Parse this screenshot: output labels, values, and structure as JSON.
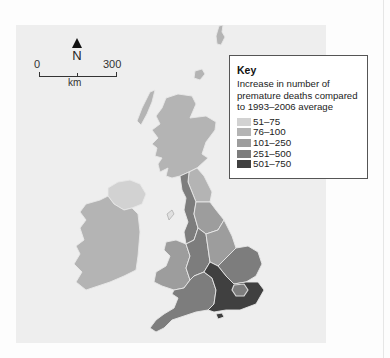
{
  "map": {
    "north_label": "N",
    "scale": {
      "zero": "0",
      "max": "300",
      "unit": "km"
    },
    "regions": [
      {
        "name": "Scotland",
        "class": "76-100"
      },
      {
        "name": "Northern Ireland",
        "class": "51-75"
      },
      {
        "name": "Republic of Ireland",
        "class": "76-100"
      },
      {
        "name": "North East England",
        "class": "76-100"
      },
      {
        "name": "North West England",
        "class": "251-500"
      },
      {
        "name": "Yorkshire and the Humber",
        "class": "101-250"
      },
      {
        "name": "Wales",
        "class": "101-250"
      },
      {
        "name": "West Midlands",
        "class": "251-500"
      },
      {
        "name": "East Midlands",
        "class": "101-250"
      },
      {
        "name": "East of England",
        "class": "251-500"
      },
      {
        "name": "London",
        "class": "251-500"
      },
      {
        "name": "South East England",
        "class": "501-750"
      },
      {
        "name": "South West England",
        "class": "251-500"
      }
    ]
  },
  "key": {
    "title": "Key",
    "description": "Increase in number of premature deaths compared to 1993–2006 average",
    "items": [
      {
        "label": "51–75",
        "color": "#d2d2d2"
      },
      {
        "label": "76–100",
        "color": "#b4b4b4"
      },
      {
        "label": "101–250",
        "color": "#9d9d9d"
      },
      {
        "label": "251–500",
        "color": "#7d7d7d"
      },
      {
        "label": "501–750",
        "color": "#404040"
      }
    ]
  }
}
